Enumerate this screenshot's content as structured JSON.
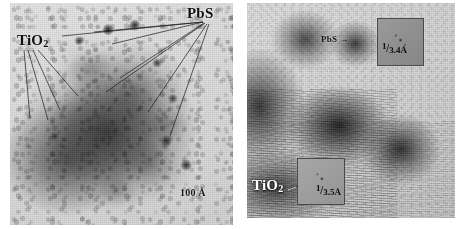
{
  "figure": {
    "kind": "tem-micrograph-pair",
    "background_color": "#ffffff",
    "panels": [
      {
        "id": "left",
        "description": "Transmission electron micrograph of a TiO2 nanoparticle aggregate decorated with darker PbS nanocrystals",
        "labels": [
          {
            "name": "tio2",
            "text": "TiO",
            "subscript": "2"
          },
          {
            "name": "pbs",
            "text": "PbS"
          }
        ],
        "scale_bar": {
          "value": "100",
          "unit": "Å",
          "text": "100 Å"
        }
      },
      {
        "id": "right",
        "description": "High-resolution TEM image showing lattice fringes of TiO2 and a PbS nanoparticle, with two Fourier-transform insets",
        "labels": [
          {
            "name": "pbs",
            "text": "PbS",
            "arrow": "→"
          },
          {
            "name": "tio2",
            "text": "TiO",
            "subscript": "2"
          }
        ],
        "insets": [
          {
            "name": "pbs-fft",
            "numerator": "1",
            "denominator": "3.4Å",
            "text": "1/3.4Å"
          },
          {
            "name": "tio2-fft",
            "numerator": "1",
            "denominator": "3.5Å",
            "text": "1/3.5Å"
          }
        ]
      }
    ],
    "colors": {
      "page_background": "#ffffff",
      "micrograph_light": "#dedede",
      "micrograph_dark": "#202020",
      "label_dark": "#111111",
      "label_light": "#ffffff",
      "inset_border": "#4a4a4a",
      "leader_line": "#1a1a1a"
    }
  }
}
